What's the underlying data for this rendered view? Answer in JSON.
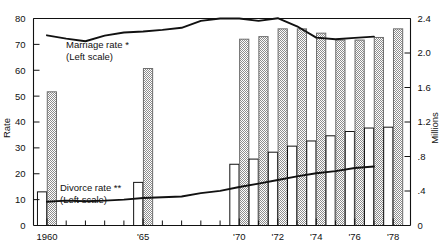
{
  "chart_data": {
    "type": "bar",
    "title": "",
    "subtitle": "",
    "xlabel": "",
    "ylabel": "Rate",
    "y2label": "Millions",
    "grid": false,
    "legend_position": "inline-annotations",
    "ylim": [
      0,
      80
    ],
    "y2lim": [
      0,
      2.4
    ],
    "xlim": [
      1959.3,
      1978.9
    ],
    "yticks": [
      "0",
      "10",
      "20",
      "30",
      "40",
      "50",
      "60",
      "70",
      "80"
    ],
    "ytick_values": [
      0,
      10,
      20,
      30,
      40,
      50,
      60,
      70,
      80
    ],
    "y2ticks": [
      "0",
      ".4",
      ".8",
      "1.2",
      "1.6",
      "2.0",
      "2.4"
    ],
    "y2tick_values": [
      0,
      0.4,
      0.8,
      1.2,
      1.6,
      2.0,
      2.4
    ],
    "xticks": [
      "1960",
      "'65",
      "'70",
      "'72",
      "'74",
      "'76",
      "'78"
    ],
    "xtick_values": [
      1960,
      1965,
      1970,
      1972,
      1974,
      1976,
      1978
    ],
    "x_minor_values": [
      1961,
      1962,
      1963,
      1964,
      1966,
      1967,
      1968,
      1969,
      1971,
      1973,
      1975,
      1977
    ],
    "bar_years": [
      1960,
      1965,
      1970,
      1971,
      1972,
      1973,
      1974,
      1975,
      1976,
      1977,
      1978
    ],
    "series": [
      {
        "name": "Divorces",
        "kind": "bar",
        "style": "open",
        "axis": "right",
        "unit": "Millions",
        "x": [
          1960,
          1965,
          1970,
          1971,
          1972,
          1973,
          1974,
          1975,
          1976,
          1977,
          1978
        ],
        "values": [
          0.39,
          0.5,
          0.71,
          0.77,
          0.85,
          0.92,
          0.98,
          1.04,
          1.09,
          1.13,
          1.14
        ]
      },
      {
        "name": "Marriages",
        "kind": "bar",
        "style": "hatched",
        "axis": "right",
        "unit": "Millions",
        "x": [
          1960,
          1965,
          1970,
          1971,
          1972,
          1973,
          1974,
          1975,
          1976,
          1977,
          1978
        ],
        "values": [
          1.55,
          1.82,
          2.16,
          2.19,
          2.28,
          2.28,
          2.23,
          2.15,
          2.15,
          2.18,
          2.28
        ]
      },
      {
        "name": "Marriage rate",
        "kind": "line",
        "axis": "left",
        "x": [
          1960,
          1961,
          1962,
          1963,
          1964,
          1965,
          1966,
          1967,
          1968,
          1969,
          1970,
          1971,
          1972,
          1973,
          1974,
          1975,
          1976,
          1977
        ],
        "values": [
          73.5,
          72.2,
          71.2,
          73.4,
          74.6,
          75.0,
          75.6,
          76.4,
          79.1,
          80.0,
          80.0,
          79.1,
          80.1,
          77.0,
          72.6,
          72.0,
          72.5,
          73.0
        ]
      },
      {
        "name": "Divorce rate",
        "kind": "line",
        "axis": "left",
        "x": [
          1960,
          1961,
          1962,
          1963,
          1964,
          1965,
          1966,
          1967,
          1968,
          1969,
          1970,
          1971,
          1972,
          1973,
          1974,
          1975,
          1976,
          1977
        ],
        "values": [
          9.2,
          9.6,
          9.4,
          9.6,
          10.0,
          10.6,
          10.9,
          11.2,
          12.5,
          13.4,
          14.9,
          16.2,
          17.6,
          19.0,
          20.2,
          21.0,
          22.2,
          22.8
        ]
      }
    ],
    "annotations": [
      {
        "id": "marriage",
        "line1": "Marriage rate *",
        "line2": "(Left scale)"
      },
      {
        "id": "divorce",
        "line1": "Divorce rate **",
        "line2": "(Left scale)"
      }
    ]
  },
  "colors": {
    "ink": "#111111",
    "bar_open_fill": "#ffffff",
    "bar_hatch_fill": "#b0b0b0",
    "bar_hatch_edge": "#6e6e6e",
    "background": "#ffffff"
  }
}
